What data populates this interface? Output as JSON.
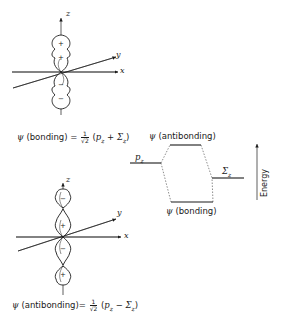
{
  "bonding_orbital": {
    "axes": {
      "z": "z",
      "y": "y",
      "x": "x"
    },
    "lobe_signs": [
      "+",
      "+",
      "−",
      "−"
    ],
    "equation": {
      "psi": "ψ",
      "label": "(bonding)",
      "equals": "=",
      "frac_num": "1",
      "frac_den": "√2",
      "open": "(",
      "term1": "p",
      "term1_sub": "z",
      "operator": "+",
      "term2": "Σ",
      "term2_sub": "z",
      "close": ")"
    }
  },
  "antibonding_orbital": {
    "axes": {
      "z": "z",
      "y": "y",
      "x": "x"
    },
    "lobe_signs": [
      "−",
      "+",
      "−",
      "+"
    ],
    "equation": {
      "psi": "ψ",
      "label": "(antibonding)",
      "equals": "=",
      "frac_num": "1",
      "frac_den": "√2",
      "open": "(",
      "term1": "p",
      "term1_sub": "z",
      "operator": "−",
      "term2": "Σ",
      "term2_sub": "z",
      "close": ")"
    }
  },
  "mo_diagram": {
    "antibonding_label": {
      "psi": "ψ",
      "text": "(antibonding)"
    },
    "bonding_label": {
      "psi": "ψ",
      "text": "(bonding)"
    },
    "left_level": {
      "symbol": "p",
      "sub": "z"
    },
    "right_level": {
      "symbol": "Σ",
      "sub": "z"
    },
    "energy_axis_label": "Energy"
  },
  "colors": {
    "ink": "#1a1a1a",
    "background": "#ffffff"
  }
}
